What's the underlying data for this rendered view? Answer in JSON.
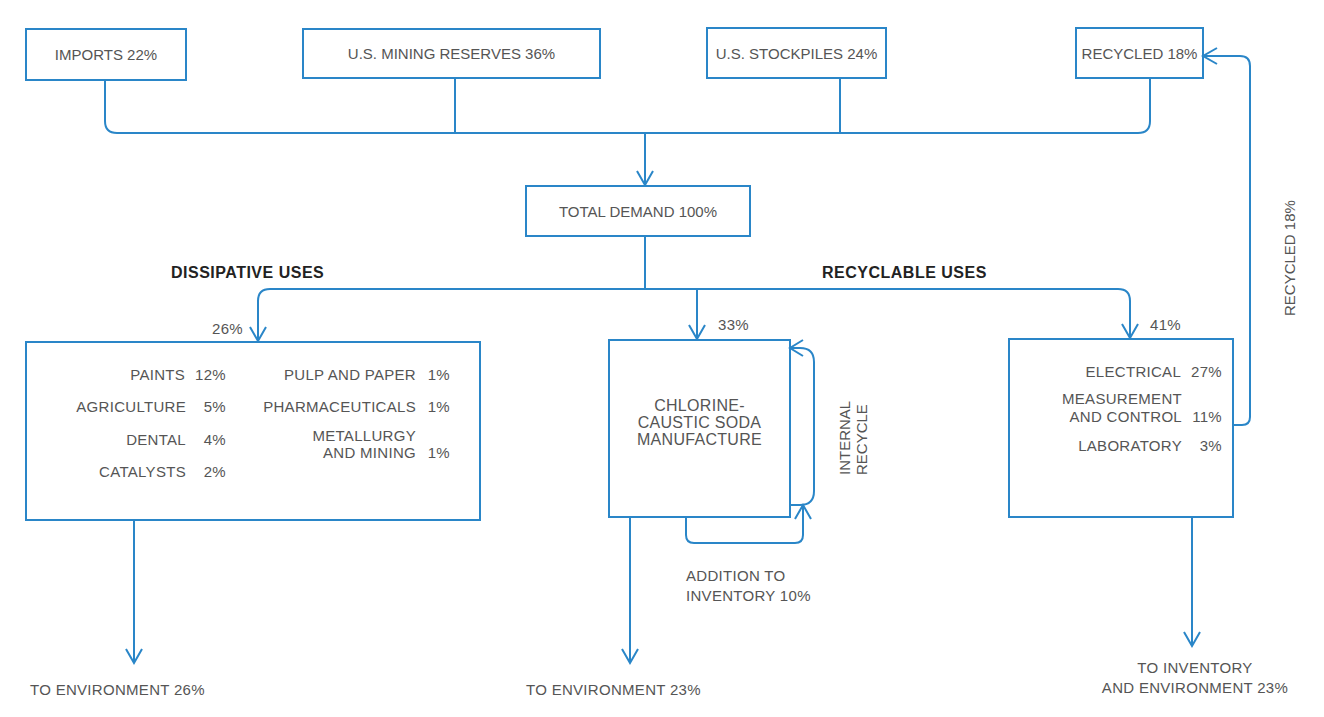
{
  "colors": {
    "line": "#2a86c8",
    "text": "#555555",
    "header": "#222222"
  },
  "sources": [
    {
      "label": "IMPORTS  22%"
    },
    {
      "label": "U.S. MINING  RESERVES 36%"
    },
    {
      "label": "U.S. STOCKPILES  24%"
    },
    {
      "label": "RECYCLED 18%"
    }
  ],
  "total_demand": {
    "label": "TOTAL  DEMAND  100%"
  },
  "headers": {
    "dissipative": "DISSIPATIVE USES",
    "recyclable": "RECYCLABLE USES"
  },
  "branch_pcts": {
    "dissipative": "26%",
    "chlorine": "33%",
    "recyclable": "41%"
  },
  "dissipative": {
    "left_items": [
      {
        "name": "PAINTS",
        "pct": "12%"
      },
      {
        "name": "AGRICULTURE",
        "pct": "5%"
      },
      {
        "name": "DENTAL",
        "pct": "4%"
      },
      {
        "name": "CATALYSTS",
        "pct": "2%"
      }
    ],
    "right_items": [
      {
        "name": "PULP AND PAPER",
        "pct": "1%"
      },
      {
        "name": "PHARMACEUTICALS",
        "pct": "1%"
      },
      {
        "name_line1": "METALLURGY",
        "name_line2": "AND  MINING",
        "pct": "1%"
      }
    ]
  },
  "chlorine": {
    "line1": "CHLORINE-",
    "line2": "CAUSTIC SODA",
    "line3": "MANUFACTURE",
    "internal_recycle_line1": "INTERNAL",
    "internal_recycle_line2": "RECYCLE",
    "addition_line1": "ADDITION TO",
    "addition_line2": "INVENTORY 10%"
  },
  "recyclable": {
    "items": [
      {
        "name": "ELECTRICAL",
        "pct": "27%"
      },
      {
        "name_line1": "MEASUREMENT",
        "name_line2": "AND CONTROL",
        "pct": "11%"
      },
      {
        "name": "LABORATORY",
        "pct": "3%"
      }
    ],
    "recycled_side_label": "RECYCLED  18%"
  },
  "outputs": {
    "dissipative": "TO ENVIRONMENT 26%",
    "chlorine": "TO ENVIRONMENT  23%",
    "recyclable_line1": "TO INVENTORY",
    "recyclable_line2": "AND ENVIRONMENT 23%"
  }
}
